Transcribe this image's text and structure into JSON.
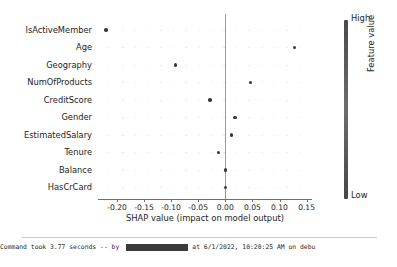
{
  "chart_data": {
    "type": "scatter",
    "title": "",
    "xlabel": "SHAP value (impact on model output)",
    "ylabel": "",
    "xlim": [
      -0.235,
      0.16
    ],
    "xticks": [
      "-0.20",
      "-0.15",
      "-0.10",
      "-0.05",
      "0.00",
      "0.05",
      "0.10",
      "0.15"
    ],
    "xtick_values": [
      -0.2,
      -0.15,
      -0.1,
      -0.05,
      0.0,
      0.05,
      0.1,
      0.15
    ],
    "grid": false,
    "legend": "colorbar-right",
    "categories": [
      "IsActiveMember",
      "Age",
      "Geography",
      "NumOfProducts",
      "CreditScore",
      "Gender",
      "EstimatedSalary",
      "Tenure",
      "Balance",
      "HasCrCard"
    ],
    "values": [
      -0.22,
      0.128,
      -0.092,
      0.047,
      -0.028,
      0.018,
      0.011,
      -0.012,
      0.0,
      0.0
    ],
    "zero_reference_line": 0.0,
    "colorbar": {
      "high_label": "High",
      "low_label": "Low",
      "title": "Feature value",
      "high_color": "#4a4a4a",
      "low_color": "#474747"
    }
  },
  "axis": {
    "x_title": "SHAP value (impact on model output)"
  },
  "status": {
    "prefix": "Command took 3.77 seconds -- by",
    "suffix": "at 6/1/2022, 10:20:25 AM on debu"
  }
}
